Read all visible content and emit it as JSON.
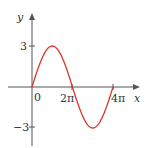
{
  "chart_data": {
    "type": "line",
    "title": "",
    "function": "y = 3 sin(x/2)",
    "xlabel": "x",
    "ylabel": "y",
    "x_ticks": [
      {
        "value": 0,
        "label": "0"
      },
      {
        "value": 6.2832,
        "label": "2π"
      },
      {
        "value": 12.5664,
        "label": "4π"
      }
    ],
    "y_ticks": [
      {
        "value": 3,
        "label": "3"
      },
      {
        "value": -3,
        "label": "−3"
      }
    ],
    "xlim": [
      -2.2,
      14.8
    ],
    "ylim": [
      -4.3,
      5.1
    ],
    "grid": false,
    "series": [
      {
        "name": "3 sin(x/2)",
        "color": "#d9342b",
        "x": [
          0,
          1.5708,
          3.1416,
          4.7124,
          6.2832,
          7.854,
          9.4248,
          10.9956,
          12.5664
        ],
        "y": [
          0,
          2.1213,
          3,
          2.1213,
          0,
          -2.1213,
          -3,
          -2.1213,
          0
        ]
      }
    ]
  },
  "labels": {
    "x_axis": "x",
    "y_axis": "y",
    "origin": "0",
    "two_pi": "2π",
    "four_pi": "4π",
    "y_pos": "3",
    "y_neg": "−3"
  }
}
